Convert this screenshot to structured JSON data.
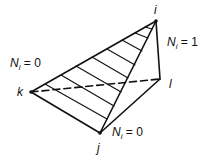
{
  "diagram": {
    "type": "tetrahedral element shape function",
    "nodes": [
      {
        "id": "i",
        "label": "i",
        "x": 156,
        "y": 21
      },
      {
        "id": "j",
        "label": "j",
        "x": 100,
        "y": 133
      },
      {
        "id": "k",
        "label": "k",
        "x": 31,
        "y": 92
      },
      {
        "id": "l",
        "label": "l",
        "x": 160,
        "y": 79
      }
    ],
    "annotations": [
      {
        "id": "ni-one",
        "symbol": "N",
        "subscript": "i",
        "rhs": "= 1"
      },
      {
        "id": "ni-zero-left",
        "symbol": "N",
        "subscript": "i",
        "rhs": "= 0"
      },
      {
        "id": "ni-zero-bottom",
        "symbol": "N",
        "subscript": "i",
        "rhs": "= 0"
      }
    ],
    "hatch_count": 8,
    "colors": {
      "stroke": "#111111",
      "background": "#ffffff"
    }
  }
}
